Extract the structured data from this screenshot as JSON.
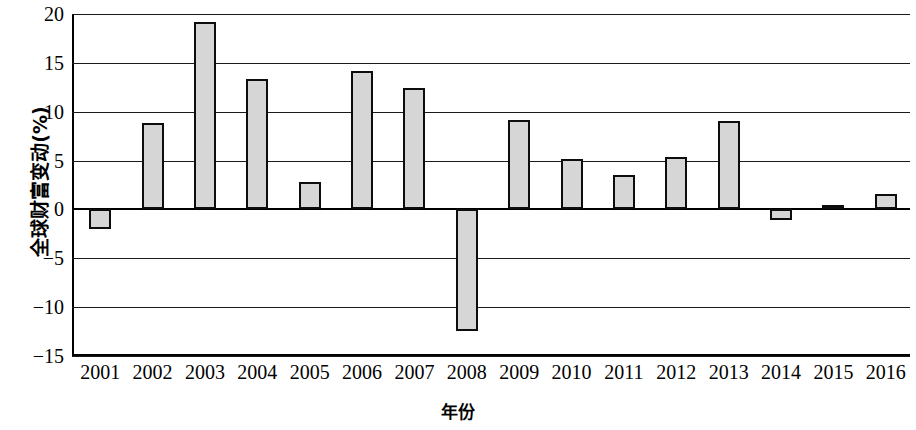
{
  "chart_data": {
    "type": "bar",
    "title": "",
    "subtitle": "",
    "xlabel": "年份",
    "ylabel": "全球财富变动(%)",
    "categories": [
      "2001",
      "2002",
      "2003",
      "2004",
      "2005",
      "2006",
      "2007",
      "2008",
      "2009",
      "2010",
      "2011",
      "2012",
      "2013",
      "2014",
      "2015",
      "2016"
    ],
    "values": [
      -2.0,
      8.8,
      19.2,
      13.3,
      2.8,
      14.2,
      12.4,
      -12.4,
      9.2,
      5.2,
      3.5,
      5.4,
      9.0,
      -1.1,
      0.5,
      1.6
    ],
    "series": [
      {
        "name": "全球财富变动(%)",
        "values": [
          -2.0,
          8.8,
          19.2,
          13.3,
          2.8,
          14.2,
          12.4,
          -12.4,
          9.2,
          5.2,
          3.5,
          5.4,
          9.0,
          -1.1,
          0.5,
          1.6
        ]
      }
    ],
    "ylim": [
      -15,
      20
    ],
    "yticks": [
      20,
      15,
      10,
      5,
      0,
      -5,
      -10,
      -15
    ],
    "ytick_labels": [
      "20",
      "15",
      "10",
      "5",
      "0",
      "−5",
      "−10",
      "−15"
    ],
    "grid": true,
    "legend": false,
    "legend_position": "none",
    "bar_fill_color": "#d6d6d6",
    "bar_border_color": "#0d0d0d",
    "axis_color": "#000000",
    "background_color": "#ffffff"
  }
}
